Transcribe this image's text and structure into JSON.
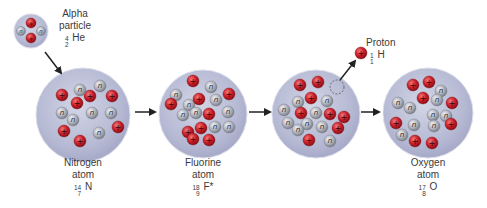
{
  "diagram": {
    "type": "nuclear-reaction",
    "colors": {
      "nucleus_fill": "#b9bdd6",
      "nucleus_edge": "#d9dbea",
      "proton": "#c8202a",
      "proton_highlight": "#f07070",
      "neutron": "#9a9ea8",
      "neutron_highlight": "#e8e8ee",
      "arrow": "#222222",
      "text": "#3a3a3a"
    },
    "alpha": {
      "name_line1": "Alpha",
      "name_line2": "particle",
      "mass": "4",
      "atomic": "2",
      "symbol": "He"
    },
    "nitrogen": {
      "name": "Nitrogen",
      "subname": "atom",
      "mass": "14",
      "atomic": "7",
      "symbol": "N"
    },
    "fluorine": {
      "name": "Fluorine",
      "subname": "atom",
      "mass": "18",
      "atomic": "9",
      "symbol": "F*"
    },
    "proton": {
      "name": "Proton",
      "mass": "1",
      "atomic": "1",
      "symbol": "H"
    },
    "oxygen": {
      "name": "Oxygen",
      "subname": "atom",
      "mass": "17",
      "atomic": "8",
      "symbol": "O"
    },
    "particle_glyphs": {
      "proton": "+",
      "neutron": "n"
    }
  }
}
